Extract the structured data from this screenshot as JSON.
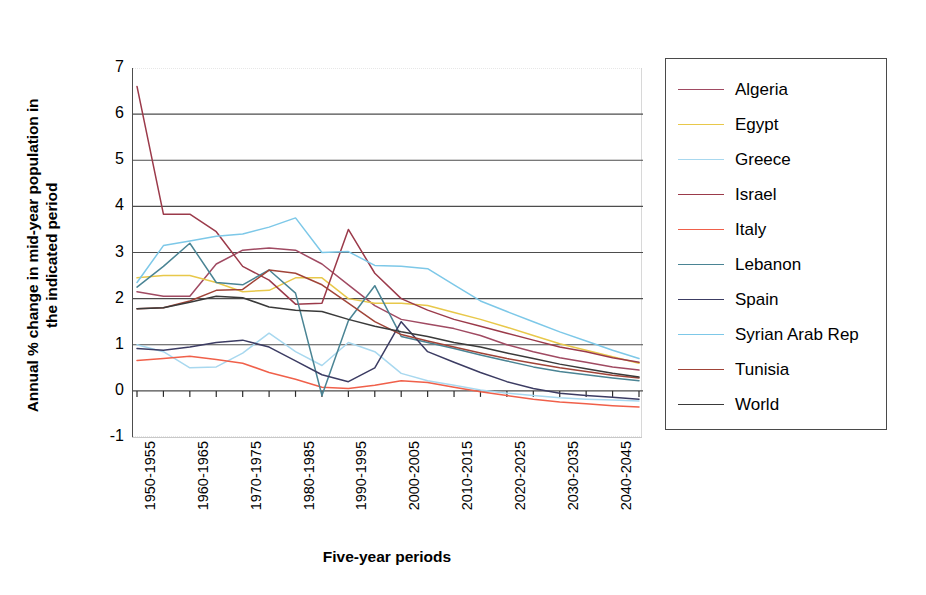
{
  "chart_data": {
    "type": "line",
    "title": "",
    "xlabel": "Five-year periods",
    "ylabel": "Annual % change in mid-year population in the indicated period",
    "ylabel_line1": "Annual % change in mid-year population in",
    "ylabel_line2": "the indicated period",
    "ylim": [
      -1,
      7
    ],
    "yticks": [
      7,
      6,
      5,
      4,
      3,
      2,
      1,
      0,
      -1
    ],
    "grid": true,
    "legend_position": "right",
    "x": [
      "1950-1955",
      "1955-1960",
      "1960-1965",
      "1965-1970",
      "1970-1975",
      "1975-1980",
      "1980-1985",
      "1985-1990",
      "1990-1995",
      "1995-2000",
      "2000-2005",
      "2005-2010",
      "2010-2015",
      "2015-2020",
      "2020-2025",
      "2025-2030",
      "2030-2035",
      "2035-2040",
      "2040-2045",
      "2045-2050"
    ],
    "xtick_labels": [
      "1950-1955",
      "1960-1965",
      "1970-1975",
      "1980-1985",
      "1990-1995",
      "2000-2005",
      "2010-2015",
      "2020-2025",
      "2030-2035",
      "2040-2045"
    ],
    "xtick_indices": [
      0,
      2,
      4,
      6,
      8,
      10,
      12,
      14,
      16,
      18
    ],
    "series": [
      {
        "name": "Algeria",
        "color": "#a04a62",
        "values": [
          2.15,
          2.05,
          2.05,
          2.75,
          3.05,
          3.1,
          3.05,
          2.75,
          2.3,
          1.85,
          1.55,
          1.45,
          1.35,
          1.2,
          1.0,
          0.85,
          0.72,
          0.62,
          0.52,
          0.45
        ]
      },
      {
        "name": "Egypt",
        "color": "#e8c84a",
        "values": [
          2.45,
          2.5,
          2.5,
          2.35,
          2.15,
          2.18,
          2.45,
          2.45,
          2.0,
          1.9,
          1.9,
          1.85,
          1.7,
          1.55,
          1.38,
          1.2,
          1.02,
          0.88,
          0.74,
          0.6
        ]
      },
      {
        "name": "Greece",
        "color": "#a8d8ef",
        "values": [
          1.0,
          0.85,
          0.5,
          0.52,
          0.82,
          1.25,
          0.85,
          0.55,
          1.05,
          0.85,
          0.38,
          0.22,
          0.12,
          0.02,
          -0.05,
          -0.1,
          -0.15,
          -0.18,
          -0.2,
          -0.22
        ]
      },
      {
        "name": "Israel",
        "color": "#9b3a4a",
        "values": [
          6.6,
          3.83,
          3.83,
          3.45,
          2.7,
          2.4,
          1.88,
          1.9,
          3.5,
          2.55,
          2.0,
          1.75,
          1.55,
          1.4,
          1.25,
          1.1,
          0.95,
          0.85,
          0.72,
          0.62
        ]
      },
      {
        "name": "Italy",
        "color": "#f0604a",
        "values": [
          0.66,
          0.7,
          0.75,
          0.68,
          0.6,
          0.4,
          0.25,
          0.08,
          0.05,
          0.12,
          0.22,
          0.18,
          0.08,
          -0.02,
          -0.1,
          -0.18,
          -0.24,
          -0.28,
          -0.32,
          -0.35
        ]
      },
      {
        "name": "Lebanon",
        "color": "#4a8494",
        "values": [
          2.25,
          2.7,
          3.2,
          2.35,
          2.3,
          2.62,
          2.12,
          -0.1,
          1.52,
          2.28,
          1.18,
          1.05,
          0.92,
          0.78,
          0.65,
          0.52,
          0.42,
          0.35,
          0.28,
          0.22
        ]
      },
      {
        "name": "Spain",
        "color": "#3c3c63",
        "values": [
          0.92,
          0.88,
          0.95,
          1.05,
          1.1,
          0.95,
          0.65,
          0.35,
          0.2,
          0.5,
          1.5,
          0.85,
          0.62,
          0.4,
          0.2,
          0.05,
          -0.05,
          -0.1,
          -0.14,
          -0.18
        ]
      },
      {
        "name": "Syrian Arab Rep",
        "color": "#7dc8e8",
        "values": [
          2.35,
          3.15,
          3.25,
          3.35,
          3.4,
          3.55,
          3.75,
          3.0,
          3.02,
          2.72,
          2.7,
          2.65,
          2.3,
          1.95,
          1.72,
          1.5,
          1.28,
          1.08,
          0.88,
          0.7
        ]
      },
      {
        "name": "Tunisia",
        "color": "#a04438",
        "values": [
          1.78,
          1.8,
          1.95,
          2.18,
          2.2,
          2.62,
          2.55,
          2.3,
          1.9,
          1.5,
          1.22,
          1.08,
          0.95,
          0.82,
          0.7,
          0.6,
          0.5,
          0.42,
          0.34,
          0.28
        ]
      },
      {
        "name": "World",
        "color": "#3a3a3a",
        "values": [
          1.78,
          1.8,
          1.92,
          2.05,
          2.02,
          1.82,
          1.75,
          1.72,
          1.55,
          1.4,
          1.28,
          1.18,
          1.05,
          0.95,
          0.82,
          0.7,
          0.58,
          0.48,
          0.38,
          0.3
        ]
      }
    ]
  },
  "legend": {
    "items": [
      {
        "label": "Algeria"
      },
      {
        "label": "Egypt"
      },
      {
        "label": "Greece"
      },
      {
        "label": "Israel"
      },
      {
        "label": "Italy"
      },
      {
        "label": "Lebanon"
      },
      {
        "label": "Spain"
      },
      {
        "label": "Syrian Arab Rep"
      },
      {
        "label": "Tunisia"
      },
      {
        "label": "World"
      }
    ]
  }
}
